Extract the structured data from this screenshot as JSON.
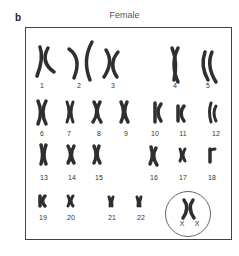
{
  "panel": {
    "letter": "b",
    "title": "Female"
  },
  "chromosomes": [
    {
      "label": "1"
    },
    {
      "label": "2"
    },
    {
      "label": "3"
    },
    {
      "label": "4"
    },
    {
      "label": "5"
    },
    {
      "label": "6"
    },
    {
      "label": "7"
    },
    {
      "label": "8"
    },
    {
      "label": "9"
    },
    {
      "label": "10"
    },
    {
      "label": "11"
    },
    {
      "label": "12"
    },
    {
      "label": "13"
    },
    {
      "label": "14"
    },
    {
      "label": "15"
    },
    {
      "label": "16"
    },
    {
      "label": "17"
    },
    {
      "label": "18"
    },
    {
      "label": "19"
    },
    {
      "label": "20"
    },
    {
      "label": "21"
    },
    {
      "label": "22"
    }
  ],
  "sex_chromosomes": {
    "label_left": "X",
    "label_right": "X",
    "highlighted": true
  }
}
